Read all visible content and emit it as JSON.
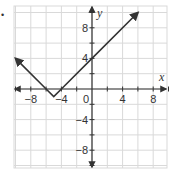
{
  "bullet": "•",
  "chart_data": {
    "type": "line",
    "title": "",
    "xlabel": "x",
    "ylabel": "y",
    "xlim": [
      -10,
      10
    ],
    "ylim": [
      -10.3,
      10.8
    ],
    "grid": true,
    "grid_step": 2,
    "x_ticks": [
      -8,
      -4,
      0,
      4,
      8
    ],
    "y_ticks": [
      8,
      4,
      -4,
      -8
    ],
    "x_tick_labels": [
      "−8",
      "−4",
      "0",
      "4",
      "8"
    ],
    "y_tick_labels": [
      "8",
      "4",
      "−4",
      "−8"
    ],
    "origin_label": "0",
    "series": [
      {
        "name": "y = |x + 5| − 1",
        "x": [
          -10,
          -6,
          -5,
          -4,
          0,
          6
        ],
        "y": [
          4,
          0,
          -1,
          0,
          4,
          10
        ],
        "arrows": "both ends"
      }
    ],
    "colors": {
      "line": "#333333",
      "grid": "#d9d9d9",
      "axis": "#333333"
    }
  }
}
